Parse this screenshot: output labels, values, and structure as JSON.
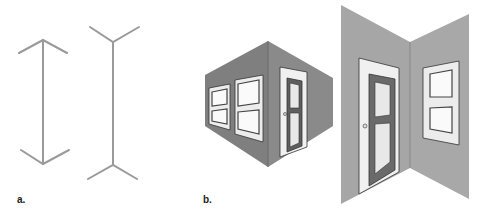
{
  "figure": {
    "panels": [
      {
        "id": "a",
        "label": "a.",
        "description": "Müller-Lyer illusion: two vertical lines with inward and outward fins"
      },
      {
        "id": "b",
        "label": "b.",
        "description": "Room corner perspective illustrations: outside corner with framed pictures and door; inside corner with door and framed pictures"
      }
    ]
  },
  "colors": {
    "line": "#9a9a9a",
    "wall_dark": "#7d7d7d",
    "wall_light": "#a6a6a6",
    "frame_white": "#f2f2f2",
    "door_dark": "#5e5e5e",
    "outline": "#333333"
  }
}
